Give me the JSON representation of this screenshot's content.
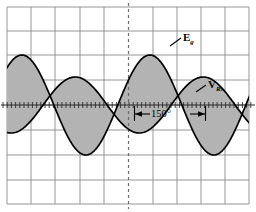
{
  "figure": {
    "name": "oscilloscope-waveform-plot",
    "background_color": "#ffffff",
    "frame_color": "#8a8a8a",
    "grid_color": "#8a8a8a",
    "curve_color": "#000000",
    "shade_color": "#b3b3b3",
    "axis_color": "#444444"
  },
  "labels": {
    "source_symbol": "E",
    "source_subscript": "g",
    "resistor_symbol": "V",
    "resistor_subscript": "R",
    "resistor_subscript2": "s",
    "phase_angle": "150°"
  },
  "chart_data": {
    "type": "line",
    "title": "",
    "subtitle": "",
    "xlabel": "",
    "ylabel": "",
    "grid": true,
    "legend_position": "inline-annotation",
    "annotations": [
      {
        "text": "E",
        "subscript": "g",
        "x_px": 183,
        "y_px": 31,
        "target": "Eg-curve"
      },
      {
        "text": "V",
        "subscript": "R",
        "subscript2": "s",
        "x_px": 208,
        "y_px": 78,
        "target": "VRs-curve"
      },
      {
        "text": "150°",
        "x_px": 151,
        "y_px": 108,
        "type": "double-arrow-span",
        "span_start_px": 134,
        "span_end_px": 206,
        "meaning": "phase shift between Eg and VRs"
      }
    ],
    "x": [
      0,
      10,
      20,
      30,
      40,
      50,
      60,
      70,
      80,
      90,
      100,
      110,
      120,
      130,
      140,
      150,
      160,
      170,
      180,
      190,
      200,
      210,
      220,
      230,
      240,
      250,
      260,
      270,
      280,
      290,
      300,
      310,
      320,
      330,
      340,
      350,
      360,
      370,
      380,
      390,
      400,
      410,
      420,
      430,
      440,
      450,
      460,
      470,
      480,
      490,
      500,
      510,
      520,
      530,
      540,
      550,
      560,
      570,
      580,
      590,
      600
    ],
    "xlim": [
      0,
      600
    ],
    "ylim": [
      -1.15,
      1.15
    ],
    "x_unit": "degrees",
    "axis_y_value": 0,
    "series": [
      {
        "name": "Eg",
        "label": "E_g",
        "amplitude": 1.0,
        "phase_deg": 30,
        "period_deg": 360,
        "color": "#000000",
        "linewidth": 1.6,
        "values": [
          0.5,
          0.643,
          0.766,
          0.866,
          0.94,
          0.985,
          1.0,
          0.985,
          0.94,
          0.866,
          0.766,
          0.643,
          0.5,
          0.342,
          0.174,
          0.0,
          -0.174,
          -0.342,
          -0.5,
          -0.643,
          -0.766,
          -0.866,
          -0.94,
          -0.985,
          -1.0,
          -0.985,
          -0.94,
          -0.866,
          -0.766,
          -0.643,
          -0.5,
          -0.342,
          -0.174,
          0.0,
          0.174,
          0.342,
          0.5,
          0.643,
          0.766,
          0.866,
          0.94,
          0.985,
          1.0,
          0.985,
          0.94,
          0.866,
          0.766,
          0.643,
          0.5,
          0.342,
          0.174,
          0.0,
          -0.174,
          -0.342,
          -0.5,
          -0.643,
          -0.766,
          -0.866,
          -0.94,
          -0.985,
          -1.0
        ]
      },
      {
        "name": "VRs",
        "label": "V_Rs",
        "amplitude": 0.56,
        "phase_deg": -120,
        "period_deg": 360,
        "color": "#000000",
        "linewidth": 1.6,
        "values": [
          -0.485,
          -0.392,
          -0.287,
          -0.174,
          -0.058,
          0.058,
          0.174,
          0.287,
          0.392,
          0.485,
          0.542,
          0.56,
          0.542,
          0.485,
          0.392,
          0.287,
          0.174,
          0.058,
          -0.058,
          -0.174,
          -0.287,
          -0.392,
          -0.485,
          -0.542,
          -0.56,
          -0.542,
          -0.485,
          -0.392,
          -0.287,
          -0.174,
          -0.058,
          0.058,
          0.174,
          0.287,
          0.392,
          0.485,
          0.542,
          0.56,
          0.542,
          0.485,
          0.392,
          0.287,
          0.174,
          0.058,
          -0.058,
          -0.174,
          -0.287,
          -0.392,
          -0.485,
          -0.542,
          -0.56,
          -0.542,
          -0.485,
          -0.392,
          -0.287,
          -0.174,
          -0.058,
          0.058,
          0.174,
          0.287,
          0.392
        ]
      }
    ],
    "fill_between": {
      "series_a": "Eg",
      "series_b": "VRs",
      "color": "#b3b3b3",
      "description": "region bounded by the two curves is shaded grey"
    },
    "grid_spacing_px": 25,
    "grid_columns": 10,
    "grid_rows": 8,
    "axis_ticks": {
      "horizontal_axis_minor_ticks": true,
      "vertical_center_axis_style": "dashed"
    }
  }
}
